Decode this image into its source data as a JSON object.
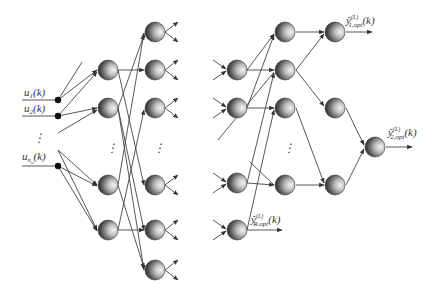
{
  "diagram": {
    "title": "",
    "inputs": [
      {
        "id": "u1",
        "label": "u",
        "sub": "1",
        "arg": "(k)",
        "y": 100
      },
      {
        "id": "u2",
        "label": "u",
        "sub": "2",
        "arg": "(k)",
        "y": 116
      },
      {
        "id": "unu",
        "label": "u",
        "sub": "n",
        "subsub": "u",
        "arg": "(k)",
        "y": 166
      }
    ],
    "input_ellipsis": "⋮",
    "outputs": [
      {
        "id": "y1",
        "hat": "ŷ",
        "sub": "1,opt",
        "sup": "(L)",
        "arg": "(k)"
      },
      {
        "id": "y2",
        "hat": "ŷ",
        "sub": "2,opt",
        "sup": "(L)",
        "arg": "(k)"
      },
      {
        "id": "yR",
        "hat": "ŷ",
        "sub": "R,opt",
        "sup": "(L)",
        "arg": "(k)"
      }
    ],
    "ellipsis": "⋮",
    "colors": {
      "node_dark": "#3a3a3a",
      "node_light": "#f2f2f2",
      "edge": "#444444",
      "dot": "#111111"
    },
    "left_network": {
      "layer1_nodes_y": [
        70,
        108,
        185,
        230
      ],
      "layer2_nodes_y": [
        32,
        70,
        108,
        185,
        230,
        270
      ]
    },
    "right_network": {
      "layerA_nodes_y": [
        70,
        108,
        183,
        230
      ],
      "layerB_nodes_y": [
        32,
        70,
        108,
        185
      ],
      "layerC_nodes_y": [
        32,
        108,
        185
      ],
      "output_node_y": 147
    }
  }
}
